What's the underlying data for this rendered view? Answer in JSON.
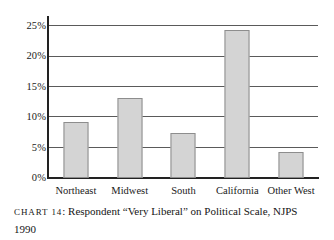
{
  "chart_data": {
    "type": "bar",
    "title": "",
    "categories": [
      "Northeast",
      "Midwest",
      "South",
      "California",
      "Other West"
    ],
    "values": [
      9.2,
      13.2,
      7.4,
      24.3,
      4.2
    ],
    "xlabel": "",
    "ylabel": "",
    "ylim": [
      0,
      26.5
    ],
    "yticks": [
      0,
      5,
      10,
      15,
      20,
      25
    ],
    "ytick_labels": [
      "0%",
      "5%",
      "10%",
      "15%",
      "20%",
      "25%"
    ],
    "grid": true,
    "legend": "none",
    "bar_color": "#d4d4d4",
    "bar_border_color": "#8d8d8d",
    "axis_color": "#222222",
    "grid_color": "#5a5a5a"
  },
  "caption": {
    "label": "Chart 14",
    "separator": ": ",
    "text": "Respondent “Very Liberal” on Political Scale, NJPS",
    "line2": "1990"
  }
}
